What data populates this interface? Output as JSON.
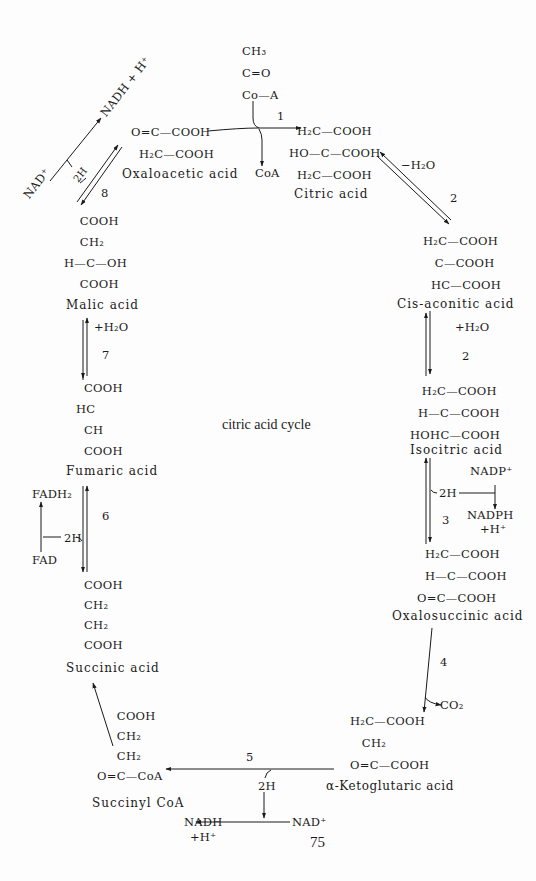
{
  "title": "citric acid cycle",
  "page_number": "75",
  "compounds": {
    "acetyl_coa": {
      "lines": [
        "CH₃",
        "C=O",
        "Co—A"
      ]
    },
    "oxaloacetic": {
      "name": "Oxaloacetic acid",
      "lines": [
        "O=C—COOH",
        "H₂C—COOH"
      ]
    },
    "citric": {
      "name": "Citric acid",
      "lines": [
        "  H₂C—COOH",
        "HO—C—COOH",
        "  H₂C—COOH"
      ]
    },
    "cis_aconitic": {
      "name": "Cis-aconitic acid",
      "lines": [
        "H₂C—COOH",
        "   C—COOH",
        "  HC—COOH"
      ]
    },
    "isocitric": {
      "name": "Isocitric acid",
      "lines": [
        "   H₂C—COOH",
        "  H—C—COOH",
        "HOHC—COOH"
      ]
    },
    "oxalosuccinic": {
      "name": "Oxalosuccinic acid",
      "lines": [
        "  H₂C—COOH",
        "  H—C—COOH",
        "O=C—COOH"
      ]
    },
    "ketoglutaric": {
      "name": "α-Ketoglutaric acid",
      "lines": [
        "H₂C—COOH",
        "   CH₂",
        "O=C—COOH"
      ]
    },
    "succinyl_coa": {
      "name": "Succinyl CoA",
      "lines": [
        "     COOH",
        "     CH₂",
        "     CH₂",
        "O=C—CoA"
      ]
    },
    "succinic": {
      "name": "Succinic acid",
      "lines": [
        "COOH",
        "CH₂",
        "CH₂",
        "COOH"
      ]
    },
    "fumaric": {
      "name": "Fumaric acid",
      "lines": [
        "  COOH",
        "HC",
        "  CH",
        "  COOH"
      ]
    },
    "malic": {
      "name": "Malic acid",
      "lines": [
        "    COOH",
        "    CH₂",
        "H—C—OH",
        "    COOH"
      ]
    }
  },
  "cofactors": {
    "coa": "CoA",
    "minus_h2o": "−H₂O",
    "plus_h2o_right": "+H₂O",
    "nadp_plus": "NADP⁺",
    "nadph": "NADPH",
    "nadph_h": "+H⁺",
    "two_h_isocitric": "2H",
    "co2": "CO₂",
    "two_h_ketoglutaric": "2H",
    "nadh_bottom": "NADH",
    "nadh_bottom_h": "+H⁺",
    "nad_plus_bottom": "NAD⁺",
    "two_h_succinic": "2H",
    "fadh2": "FADH₂",
    "fad": "FAD",
    "plus_h2o_left": "+H₂O",
    "nad_plus_top": "NAD⁺",
    "nadh_top": "NADH + H⁺",
    "two_h_malic": "2H"
  },
  "steps": [
    "1",
    "2",
    "2",
    "3",
    "4",
    "5",
    "6",
    "7",
    "8"
  ]
}
